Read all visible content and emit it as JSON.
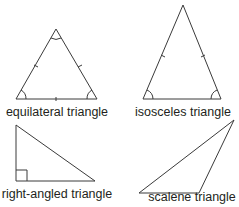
{
  "diagram": {
    "stroke_color": "#3a3a3a",
    "text_color": "#231f20",
    "triangles": [
      {
        "id": "equilateral",
        "label": "equilateral triangle",
        "vertices": [
          [
            56,
            29
          ],
          [
            16,
            99
          ],
          [
            97,
            99
          ]
        ],
        "markings": "three equal-side ticks, three angle arcs"
      },
      {
        "id": "isosceles",
        "label": "isosceles triangle",
        "vertices": [
          [
            183,
            5
          ],
          [
            143,
            99
          ],
          [
            221,
            99
          ]
        ],
        "markings": "two equal-side ticks, two base angle arcs"
      },
      {
        "id": "right-angled",
        "label": "right-angled triangle",
        "vertices": [
          [
            16,
            125
          ],
          [
            16,
            181
          ],
          [
            95,
            181
          ]
        ],
        "markings": "right-angle square at bottom-left"
      },
      {
        "id": "scalene",
        "label": "scalene triangle",
        "vertices": [
          [
            234,
            120
          ],
          [
            139,
            193
          ],
          [
            199,
            193
          ]
        ],
        "markings": "none"
      }
    ]
  }
}
